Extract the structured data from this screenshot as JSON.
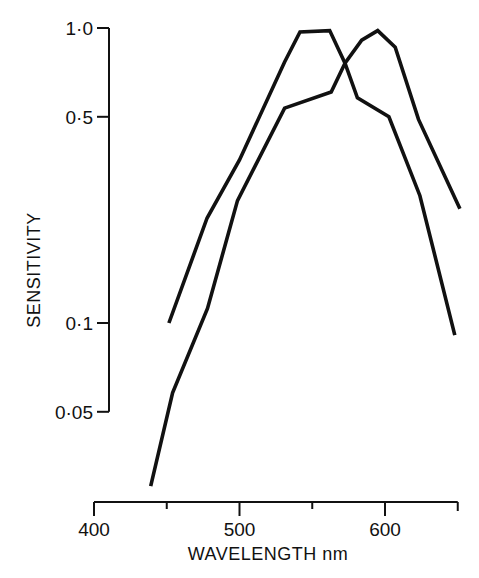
{
  "chart_data": {
    "type": "line",
    "title": "",
    "xlabel": "WAVELENGTH nm",
    "ylabel": "SENSITIVITY",
    "yscale": "log",
    "xlim": [
      400,
      650
    ],
    "ylim": [
      0.05,
      1.0
    ],
    "x_ticks": [
      {
        "value": 400,
        "label": "400"
      },
      {
        "value": 450,
        "label": ""
      },
      {
        "value": 500,
        "label": "500"
      },
      {
        "value": 550,
        "label": ""
      },
      {
        "value": 600,
        "label": "600"
      },
      {
        "value": 650,
        "label": ""
      }
    ],
    "y_ticks": [
      {
        "value": 1.0,
        "label": "1·0"
      },
      {
        "value": 0.5,
        "label": "0·5"
      },
      {
        "value": 0.1,
        "label": "0·1"
      },
      {
        "value": 0.05,
        "label": "0·05"
      }
    ],
    "grid": false,
    "legend": null,
    "series": [
      {
        "name": "curve-peak-550",
        "color": "#111111",
        "x": [
          451.5,
          477.7,
          500,
          531,
          541.6,
          562,
          572.5,
          581,
          602.7,
          624,
          648
        ],
        "y": [
          0.1,
          0.227,
          0.357,
          0.767,
          0.97,
          0.98,
          0.76,
          0.58,
          0.5,
          0.27,
          0.091
        ]
      },
      {
        "name": "curve-peak-595",
        "color": "#111111",
        "x": [
          439,
          454,
          478,
          498.6,
          531,
          563,
          572.5,
          584,
          595,
          607,
          623,
          651.5
        ],
        "y": [
          0.028,
          0.058,
          0.112,
          0.26,
          0.535,
          0.607,
          0.76,
          0.91,
          0.98,
          0.86,
          0.49,
          0.244
        ]
      }
    ]
  },
  "layout": {
    "x_px": {
      "v0": 400,
      "p0": 94,
      "v1": 600,
      "p1": 385
    },
    "y_px": {
      "v0": 1.0,
      "p0": 28,
      "v1": 0.1,
      "p1": 323
    },
    "x_axis_y": 502,
    "y_axis_x": 109
  }
}
